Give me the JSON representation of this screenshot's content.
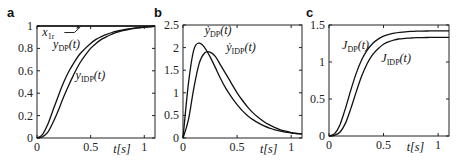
{
  "figure": {
    "panels": [
      {
        "letter": "a"
      },
      {
        "letter": "b"
      },
      {
        "letter": "c"
      }
    ]
  },
  "chart_data": [
    {
      "type": "line",
      "panel": "a",
      "xlabel": "t[s]",
      "ylabel": "",
      "xlim": [
        0,
        1.1
      ],
      "ylim": [
        0,
        1
      ],
      "xticks": [
        "0",
        "0.5",
        "1"
      ],
      "yticks": [
        "0",
        "0.2",
        "0.4",
        "0.6",
        "0.8",
        "1"
      ],
      "grid": false,
      "x": [
        0,
        0.05,
        0.1,
        0.15,
        0.2,
        0.25,
        0.3,
        0.35,
        0.4,
        0.45,
        0.5,
        0.55,
        0.6,
        0.65,
        0.7,
        0.75,
        0.8,
        0.85,
        0.9,
        0.95,
        1.0,
        1.05,
        1.1
      ],
      "series": [
        {
          "name": "x_1r",
          "label_main": "x",
          "label_sub": "1r",
          "values": [
            1,
            1,
            1,
            1,
            1,
            1,
            1,
            1,
            1,
            1,
            1,
            1,
            1,
            1,
            1,
            1,
            1,
            1,
            1,
            1,
            1,
            1,
            1
          ]
        },
        {
          "name": "y_DP(t)",
          "label_main": "y",
          "label_sub": "DP",
          "label_tail": "(t)",
          "values": [
            0,
            0.03,
            0.12,
            0.25,
            0.38,
            0.5,
            0.6,
            0.68,
            0.75,
            0.8,
            0.845,
            0.88,
            0.905,
            0.925,
            0.942,
            0.955,
            0.965,
            0.973,
            0.98,
            0.986,
            0.99,
            0.994,
            0.997
          ]
        },
        {
          "name": "y_IDP(t)",
          "label_main": "y",
          "label_sub": "IDP",
          "label_tail": "(t)",
          "values": [
            0,
            0.01,
            0.05,
            0.14,
            0.25,
            0.37,
            0.48,
            0.58,
            0.67,
            0.74,
            0.8,
            0.845,
            0.88,
            0.905,
            0.927,
            0.945,
            0.958,
            0.968,
            0.977,
            0.984,
            0.989,
            0.993,
            0.996
          ]
        }
      ],
      "annotations": [
        "x_1r (arrow pointing to y=1 line)",
        "y_DP(t)",
        "y_IDP(t)"
      ]
    },
    {
      "type": "line",
      "panel": "b",
      "xlabel": "t[s]",
      "ylabel": "",
      "xlim": [
        0,
        1.1
      ],
      "ylim": [
        0,
        2.5
      ],
      "xticks": [
        "0",
        "0.5",
        "1"
      ],
      "yticks": [
        "0",
        "0.5",
        "1",
        "1.5",
        "2",
        "2.5"
      ],
      "grid": false,
      "x": [
        0,
        0.05,
        0.1,
        0.15,
        0.2,
        0.25,
        0.3,
        0.35,
        0.4,
        0.45,
        0.5,
        0.55,
        0.6,
        0.65,
        0.7,
        0.75,
        0.8,
        0.85,
        0.9,
        0.95,
        1.0,
        1.05,
        1.1
      ],
      "series": [
        {
          "name": "ẏ_DP(t)",
          "label_main": "ẏ",
          "label_sub": "DP",
          "label_tail": "(t)",
          "values": [
            0,
            1.2,
            1.95,
            2.1,
            2.0,
            1.8,
            1.55,
            1.3,
            1.08,
            0.9,
            0.74,
            0.6,
            0.49,
            0.4,
            0.33,
            0.27,
            0.22,
            0.18,
            0.15,
            0.13,
            0.11,
            0.1,
            0.09
          ]
        },
        {
          "name": "ẏ_IDP(t)",
          "label_main": "ẏ",
          "label_sub": "IDP",
          "label_tail": "(t)",
          "values": [
            0,
            0.4,
            1.1,
            1.65,
            1.88,
            1.9,
            1.8,
            1.6,
            1.4,
            1.2,
            1.0,
            0.83,
            0.68,
            0.55,
            0.45,
            0.36,
            0.29,
            0.23,
            0.18,
            0.15,
            0.12,
            0.1,
            0.09
          ]
        }
      ],
      "annotations": [
        "ẏ_DP(t)",
        "ẏ_IDP(t)"
      ]
    },
    {
      "type": "line",
      "panel": "c",
      "xlabel": "t[s]",
      "ylabel": "",
      "xlim": [
        0,
        1.1
      ],
      "ylim": [
        0,
        1.5
      ],
      "xticks": [
        "0",
        "0.5",
        "1"
      ],
      "yticks": [
        "0",
        "0.5",
        "1",
        "1.5"
      ],
      "grid": false,
      "x": [
        0,
        0.05,
        0.1,
        0.15,
        0.2,
        0.25,
        0.3,
        0.35,
        0.4,
        0.45,
        0.5,
        0.55,
        0.6,
        0.65,
        0.7,
        0.75,
        0.8,
        0.85,
        0.9,
        0.95,
        1.0,
        1.05,
        1.1
      ],
      "series": [
        {
          "name": "J_DP(t)",
          "label_main": "J",
          "label_sub": "DP",
          "label_tail": "(t)",
          "values": [
            0,
            0.03,
            0.15,
            0.37,
            0.62,
            0.85,
            1.03,
            1.16,
            1.25,
            1.31,
            1.35,
            1.375,
            1.39,
            1.4,
            1.408,
            1.413,
            1.416,
            1.418,
            1.419,
            1.42,
            1.42,
            1.42,
            1.42
          ]
        },
        {
          "name": "J_IDP(t)",
          "label_main": "J",
          "label_sub": "IDP",
          "label_tail": "(t)",
          "values": [
            0,
            0.01,
            0.05,
            0.17,
            0.37,
            0.6,
            0.81,
            0.98,
            1.1,
            1.18,
            1.24,
            1.275,
            1.3,
            1.313,
            1.32,
            1.325,
            1.328,
            1.33,
            1.331,
            1.332,
            1.332,
            1.332,
            1.332
          ]
        }
      ],
      "annotations": [
        "J_DP(t)",
        "J_IDP(t)"
      ]
    }
  ]
}
